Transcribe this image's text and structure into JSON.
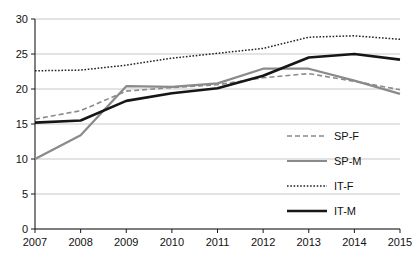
{
  "chart_data": {
    "type": "line",
    "title": "",
    "subtitle": "",
    "xlabel": "",
    "ylabel": "",
    "x": [
      2007,
      2008,
      2009,
      2010,
      2011,
      2012,
      2013,
      2014,
      2015
    ],
    "categories": [
      "2007",
      "2008",
      "2009",
      "2010",
      "2011",
      "2012",
      "2013",
      "2014",
      "2015"
    ],
    "xlim": [
      2007,
      2015
    ],
    "ylim": [
      0,
      30
    ],
    "yticks": [
      0,
      5,
      10,
      15,
      20,
      25,
      30
    ],
    "ytick_labels": [
      "0",
      "5",
      "10",
      "15",
      "20",
      "25",
      "30"
    ],
    "xticks": [
      2007,
      2008,
      2009,
      2010,
      2011,
      2012,
      2013,
      2014,
      2015
    ],
    "xtick_labels": [
      "2007",
      "2008",
      "2009",
      "2010",
      "2011",
      "2012",
      "2013",
      "2014",
      "2015"
    ],
    "grid": true,
    "grid_axis": "y",
    "legend_position": "center-right",
    "series": [
      {
        "name": "SP-F",
        "style": "dashed",
        "color": "#8a8a8a",
        "width": 1.6,
        "values": [
          15.7,
          16.9,
          19.7,
          20.2,
          20.6,
          21.6,
          22.2,
          21.1,
          19.9
        ]
      },
      {
        "name": "SP-M",
        "style": "solid",
        "color": "#8a8a8a",
        "width": 2.2,
        "values": [
          10.0,
          13.4,
          20.4,
          20.3,
          20.8,
          22.9,
          22.9,
          21.2,
          19.3
        ]
      },
      {
        "name": "IT-F",
        "style": "dotted",
        "color": "#222222",
        "width": 1.5,
        "values": [
          22.6,
          22.7,
          23.4,
          24.4,
          25.1,
          25.8,
          27.4,
          27.6,
          27.1
        ]
      },
      {
        "name": "IT-M",
        "style": "solid",
        "color": "#161616",
        "width": 2.6,
        "values": [
          15.2,
          15.5,
          18.3,
          19.4,
          20.1,
          21.9,
          24.5,
          25.0,
          24.2
        ]
      }
    ]
  },
  "legend": {
    "entries": [
      {
        "label": "SP-F"
      },
      {
        "label": "SP-M"
      },
      {
        "label": "IT-F"
      },
      {
        "label": "IT-M"
      }
    ]
  }
}
